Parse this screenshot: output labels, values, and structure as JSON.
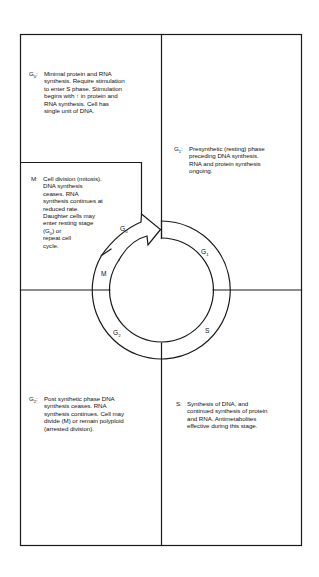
{
  "diagram": {
    "type": "cell-cycle",
    "colors": {
      "line": "#1a1a1a",
      "background": "#ffffff",
      "text": "#111111"
    },
    "ring_labels": {
      "g0": {
        "letter": "G",
        "sub": "0"
      },
      "g1": {
        "letter": "G",
        "sub": "1"
      },
      "m": {
        "letter": "M",
        "sub": ""
      },
      "g2": {
        "letter": "G",
        "sub": "2"
      },
      "s": {
        "letter": "S",
        "sub": ""
      }
    },
    "panels": {
      "g0": {
        "phase_letter": "G",
        "phase_sub": "0",
        "phase_suffix": ":",
        "lines": [
          "Minimal protein and RNA",
          "synthesis. Require stimulation",
          "to enter S phase. Stimulation",
          "begins with ↑ in protein and",
          "RNA synthesis. Cell has",
          "single unit of DNA."
        ]
      },
      "m": {
        "phase_letter": "M",
        "phase_sub": "",
        "phase_suffix": ":",
        "lines": [
          "Cell division (mitosis).",
          "DNA synthesis",
          "ceases. RNA",
          "synthesis continues at",
          "reduced rate.",
          "Daughter cells may",
          "enter resting stage"
        ],
        "line_g0_prefix": "(G",
        "line_g0_sub": "0",
        "line_g0_suffix": ") or",
        "lines_after": [
          "repeat cell",
          "cycle."
        ]
      },
      "g1": {
        "phase_letter": "G",
        "phase_sub": "1",
        "phase_suffix": ":",
        "lines": [
          "Presynthetic (resting) phase",
          "preceding DNA synthesis.",
          "RNA and protein synthesis",
          "ongoing."
        ]
      },
      "g2": {
        "phase_letter": "G",
        "phase_sub": "2",
        "phase_suffix": ":",
        "lines": [
          "Post synthetic phase DNA",
          "synthesis ceases. RNA",
          "synthesis continues. Cell may",
          "divide (M) or remain polyploid",
          "(arrested division)."
        ]
      },
      "s": {
        "phase_letter": "S",
        "phase_sub": "",
        "phase_suffix": ":",
        "lines": [
          "Synthesis of DNA, and",
          "continued synthesis of protein",
          "and RNA. Antimetabolites",
          "effective during this stage."
        ]
      }
    }
  }
}
